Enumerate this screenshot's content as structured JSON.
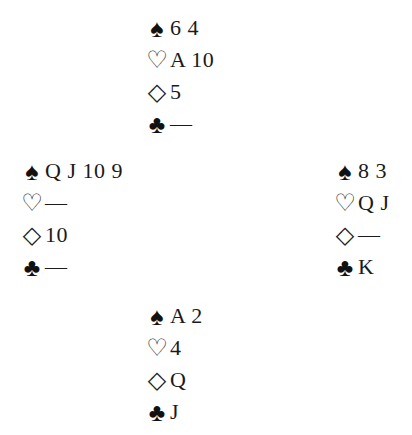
{
  "suits": {
    "spades": "♠",
    "hearts": "♡",
    "diamonds": "◇",
    "clubs": "♣"
  },
  "hands": {
    "north": {
      "spades": "6 4",
      "hearts": "A 10",
      "diamonds": "5",
      "clubs": "—"
    },
    "west": {
      "spades": "Q J 10 9",
      "hearts": "—",
      "diamonds": "10",
      "clubs": "—"
    },
    "east": {
      "spades": "8 3",
      "hearts": "Q J",
      "diamonds": "—",
      "clubs": "K"
    },
    "south": {
      "spades": "A 2",
      "hearts": "4",
      "diamonds": "Q",
      "clubs": "J"
    }
  }
}
